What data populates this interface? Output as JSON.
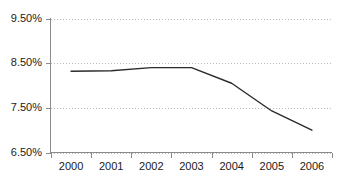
{
  "chart_data": {
    "type": "line",
    "title": "",
    "subtitle": "",
    "xlabel": "",
    "ylabel": "",
    "categories": [
      "2000",
      "2001",
      "2002",
      "2003",
      "2004",
      "2005",
      "2006"
    ],
    "x": [
      2000,
      2001,
      2002,
      2003,
      2004,
      2005,
      2006
    ],
    "values": [
      8.32,
      8.33,
      8.4,
      8.4,
      8.05,
      7.43,
      7.0
    ],
    "series": [
      {
        "name": "",
        "values": [
          8.32,
          8.33,
          8.4,
          8.4,
          8.05,
          7.43,
          7.0
        ]
      }
    ],
    "ylim": [
      6.5,
      9.5
    ],
    "ytick_values": [
      6.5,
      7.5,
      8.5,
      9.5
    ],
    "ytick_labels": [
      "6.50%",
      "7.50%",
      "8.50%",
      "9.50%"
    ],
    "xtick_labels": [
      "2000",
      "2001",
      "2002",
      "2003",
      "2004",
      "2005",
      "2006"
    ],
    "grid": true,
    "grid_axis": "y",
    "legend": false,
    "legend_position": "none",
    "annotations": [],
    "colors": {
      "line": "#2b2b2b",
      "grid": "#b9b9b9",
      "axis": "#8a8a8a",
      "text": "#1a1a1a",
      "background": "#ffffff"
    }
  },
  "axes": {
    "y_labels": [
      {
        "text": "9.50%",
        "value": 9.5
      },
      {
        "text": "8.50%",
        "value": 8.5
      },
      {
        "text": "7.50%",
        "value": 7.5
      },
      {
        "text": "6.50%",
        "value": 6.5
      }
    ],
    "x_labels": [
      {
        "text": "2000",
        "value": 2000
      },
      {
        "text": "2001",
        "value": 2001
      },
      {
        "text": "2002",
        "value": 2002
      },
      {
        "text": "2003",
        "value": 2003
      },
      {
        "text": "2004",
        "value": 2004
      },
      {
        "text": "2005",
        "value": 2005
      },
      {
        "text": "2006",
        "value": 2006
      }
    ]
  }
}
